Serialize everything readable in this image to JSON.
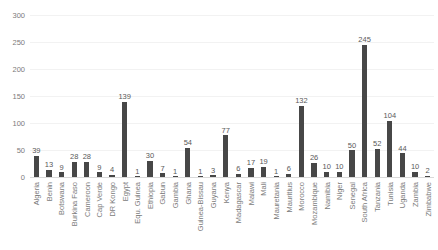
{
  "chart_data": {
    "type": "bar",
    "title": "",
    "subtitle": "",
    "xlabel": "",
    "ylabel": "",
    "ylim": [
      0,
      300
    ],
    "yticks": [
      0,
      50,
      100,
      150,
      200,
      250,
      300
    ],
    "grid": true,
    "legend": false,
    "legend_position": "none",
    "bar_color": "#474747",
    "gridline_color": "#F2F2F2",
    "tick_label_color": "#7B7B7B",
    "data_label_color": "#595959",
    "data_labels_shown": true,
    "categories": [
      "Algeria",
      "Benin",
      "Botswana",
      "Burkina Faso",
      "Cameroon",
      "Cap Verde",
      "DR Kongo",
      "Egypt",
      "Equ. Guinea",
      "Ethiopia",
      "Gabun",
      "Gambia",
      "Ghana",
      "Guinea-Bissau",
      "Guyana",
      "Kenya",
      "Madagascar",
      "Malawi",
      "Mali",
      "Mauretania",
      "Mauritius",
      "Morocco",
      "Mozambique",
      "Namibia",
      "Niger",
      "Senegal",
      "South Africa",
      "Tanzania",
      "Tunisia",
      "Uganda",
      "Zambia",
      "Zimbabwe"
    ],
    "values": [
      39,
      13,
      9,
      28,
      28,
      9,
      4,
      139,
      1,
      30,
      7,
      1,
      54,
      1,
      3,
      77,
      6,
      17,
      19,
      1,
      6,
      132,
      26,
      10,
      10,
      50,
      245,
      52,
      104,
      44,
      10,
      2
    ]
  }
}
